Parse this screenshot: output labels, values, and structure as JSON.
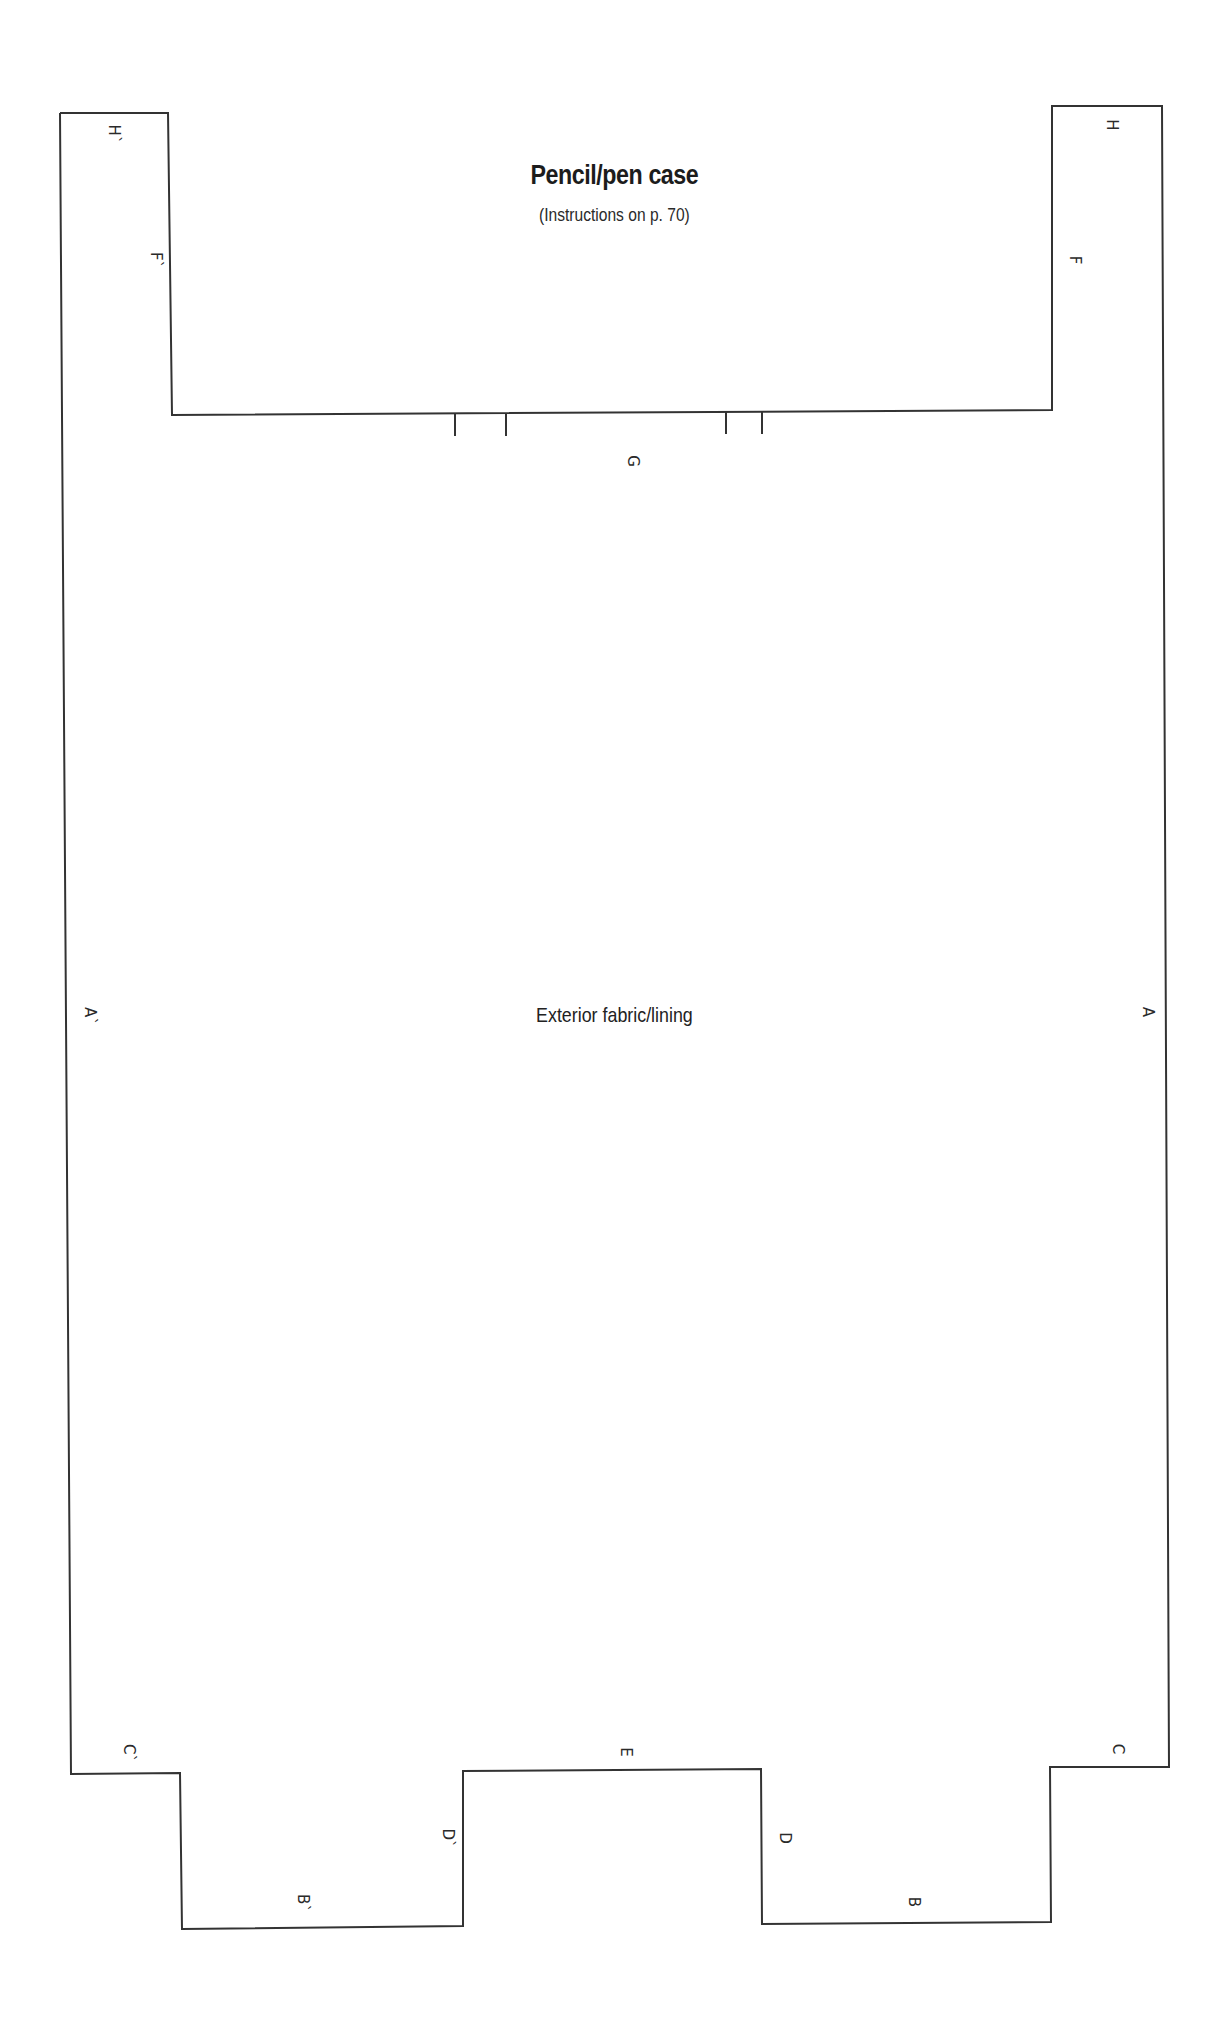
{
  "document": {
    "title": "Pencil/pen case",
    "subtitle": "(Instructions on p. 70)",
    "piece_label": "Exterior fabric/lining"
  },
  "style": {
    "outline_color": "#333333",
    "text_color": "#222222",
    "background": "#ffffff"
  },
  "marks": {
    "h_prime": "H`",
    "f_prime": "F`",
    "h": "H",
    "f": "F",
    "g": "G",
    "a_prime": "A`",
    "a": "A",
    "c_prime": "C`",
    "b_prime": "B`",
    "d_prime": "D`",
    "e": "E",
    "d": "D",
    "b": "B",
    "c": "C"
  }
}
